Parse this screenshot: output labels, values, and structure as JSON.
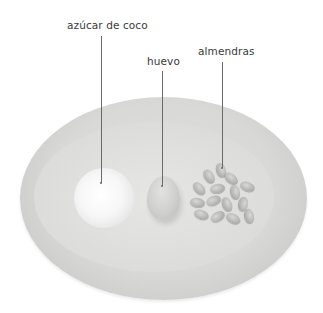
{
  "image": {
    "description": "Oval ceramic plate with three ingredients, each labeled with a leader line",
    "background_color": "#ffffff",
    "plate_color": "#d8d8d6"
  },
  "labels": [
    {
      "id": "sugar",
      "text": "azúcar de coco"
    },
    {
      "id": "egg",
      "text": "huevo"
    },
    {
      "id": "almonds",
      "text": "almendras"
    }
  ]
}
